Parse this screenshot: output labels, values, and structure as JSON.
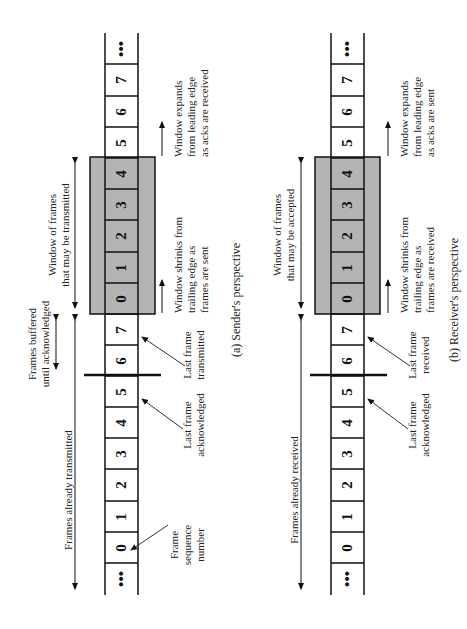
{
  "sender": {
    "caption": "(a) Sender's perspective",
    "cells": [
      "•••",
      "0",
      "1",
      "2",
      "3",
      "4",
      "5",
      "6",
      "7",
      "0",
      "1",
      "2",
      "3",
      "4",
      "5",
      "6",
      "7",
      "•••"
    ],
    "window_label": [
      "Window of frames",
      "that may be transmitted"
    ],
    "already_label": "Frames already transmitted",
    "buffered_label": [
      "Frames buffered",
      "until acknowledged"
    ],
    "shrinks_label": [
      "Window shrinks from",
      "trailing edge as",
      "frames are sent"
    ],
    "expands_label": [
      "Window expands",
      "from leading edge",
      "as acks are received"
    ],
    "last_tx_label": [
      "Last frame",
      "transmitted"
    ],
    "last_ack_label": [
      "Last frame",
      "acknowledged"
    ],
    "seq_label": [
      "Frame",
      "sequence",
      "number"
    ]
  },
  "receiver": {
    "caption": "(b) Receiver's perspective",
    "cells": [
      "•••",
      "0",
      "1",
      "2",
      "3",
      "4",
      "5",
      "6",
      "7",
      "0",
      "1",
      "2",
      "3",
      "4",
      "5",
      "6",
      "7",
      "•••"
    ],
    "window_label": [
      "Window of frames",
      "that may be accepted"
    ],
    "already_label": "Frames already received",
    "shrinks_label": [
      "Window shrinks from",
      "trailing edge as",
      "frames are received"
    ],
    "expands_label": [
      "Window expands",
      "from leading edge",
      "as acks are sent"
    ],
    "last_rx_label": [
      "Last frame",
      "received"
    ],
    "last_ack_label": [
      "Last frame",
      "acknowledged"
    ]
  },
  "colors": {
    "window_fill": "#b4b4b4",
    "line": "#111111"
  }
}
